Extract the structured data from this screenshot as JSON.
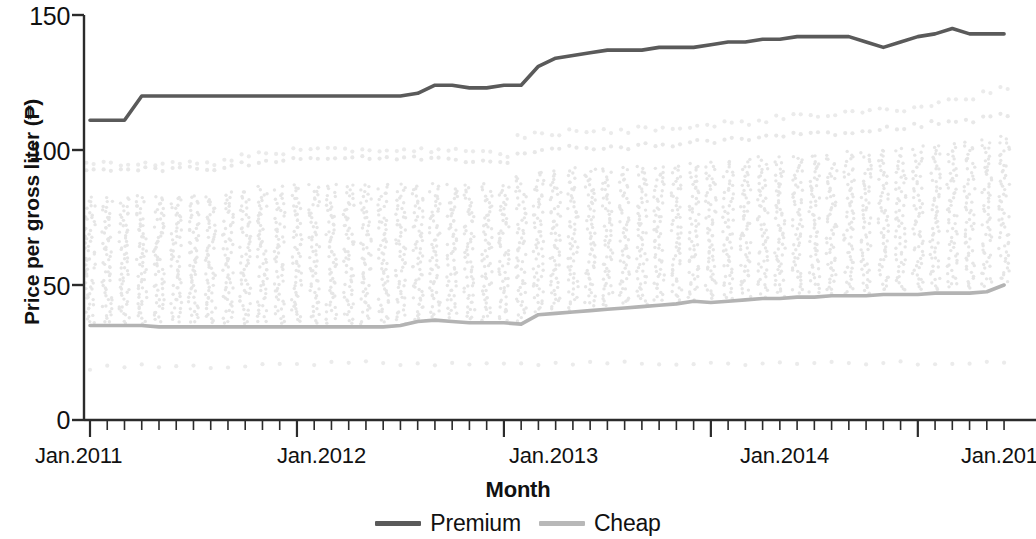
{
  "chart_data": {
    "type": "line",
    "title": "",
    "xlabel": "Month",
    "ylabel": "Price per gross liter (₱)",
    "ylim": [
      0,
      150
    ],
    "yticks": [
      0,
      50,
      100,
      150
    ],
    "ytick_labels": [
      "0",
      "50",
      "100",
      "150"
    ],
    "xlim": [
      "Jan.2011",
      "Jun.2015"
    ],
    "xticks": [
      "Jan.2011",
      "Jan.2012",
      "Jan.2013",
      "Jan.2014",
      "Jan.2015"
    ],
    "xtick_labels": [
      "Jan.2011",
      "Jan.2012",
      "Jan.2013",
      "Jan.2014",
      "Jan.2015"
    ],
    "grid": false,
    "legend_position": "bottom-center",
    "x_minor_tick_interval_months": 1,
    "n_months": 54,
    "series": [
      {
        "name": "Premium",
        "color": "#5a5a5a",
        "style": "solid-line",
        "values": [
          111,
          111,
          111,
          120,
          120,
          120,
          120,
          120,
          120,
          120,
          120,
          120,
          120,
          120,
          120,
          120,
          120,
          120,
          120,
          121,
          124,
          124,
          123,
          123,
          124,
          124,
          131,
          134,
          135,
          136,
          137,
          137,
          137,
          138,
          138,
          138,
          139,
          140,
          140,
          141,
          141,
          142,
          142,
          142,
          142,
          140,
          138,
          140,
          142,
          143,
          145,
          143,
          143,
          143
        ]
      },
      {
        "name": "Cheap",
        "color": "#b3b3b3",
        "style": "solid-line",
        "values": [
          35,
          35,
          35,
          35,
          34.5,
          34.5,
          34.5,
          34.5,
          34.5,
          34.5,
          34.5,
          34.5,
          34.5,
          34.5,
          34.5,
          34.5,
          34.5,
          34.5,
          35,
          36.5,
          37,
          36.5,
          36,
          36,
          36,
          35.5,
          39,
          39.5,
          40,
          40.5,
          41,
          41.5,
          42,
          42.5,
          43,
          44,
          43.5,
          44,
          44.5,
          45,
          45,
          45.5,
          45.5,
          46,
          46,
          46,
          46.5,
          46.5,
          46.5,
          47,
          47,
          47,
          47.5,
          50
        ]
      }
    ],
    "scatter_bands": [
      {
        "name": "upper-outlier-dots",
        "color": "#ebebeb",
        "values": [
          95,
          95,
          95,
          95,
          95,
          95,
          95,
          95,
          96,
          98,
          99,
          99,
          100,
          100,
          100,
          100,
          100,
          100,
          100,
          100,
          100,
          100,
          99,
          99,
          98,
          105,
          106,
          106,
          107,
          107,
          107,
          107,
          108,
          108,
          108,
          109,
          109,
          110,
          110,
          111,
          112,
          113,
          113,
          113,
          114,
          114,
          115,
          115,
          116,
          117,
          118,
          119,
          121,
          123
        ]
      },
      {
        "name": "secondary-upper-dots",
        "color": "#e8e8e8",
        "values": [
          93,
          93,
          93,
          93,
          93,
          93,
          93,
          93,
          94,
          95,
          96,
          96,
          97,
          97,
          97,
          97,
          97,
          97,
          97,
          97,
          97,
          97,
          96,
          96,
          96,
          99,
          100,
          100,
          101,
          101,
          101,
          101,
          102,
          102,
          102,
          103,
          103,
          104,
          104,
          105,
          105,
          106,
          106,
          106,
          107,
          107,
          108,
          108,
          109,
          110,
          110,
          111,
          112,
          113
        ]
      },
      {
        "name": "lower-outlier-dots",
        "color": "#ebebeb",
        "values": [
          19,
          19.5,
          20,
          20,
          20,
          20,
          20,
          20,
          20,
          20.5,
          20.5,
          20.5,
          21,
          21,
          21,
          21,
          21,
          21,
          21,
          21,
          21,
          21,
          21,
          21,
          21,
          21,
          21,
          21,
          21,
          21,
          21,
          21,
          21,
          21,
          21,
          21,
          21,
          21,
          21,
          21,
          21,
          21,
          21,
          21,
          21,
          21,
          21,
          21,
          21,
          21,
          21,
          21,
          21,
          21
        ]
      }
    ],
    "scatter_columns": {
      "name": "monthly-observation-dots",
      "color": "#e6e6e6",
      "description": "vertical column of individual price observations per month",
      "top_values": [
        82,
        82,
        82,
        83,
        83,
        83,
        83,
        83,
        84,
        85,
        86,
        86,
        87,
        87,
        87,
        87,
        87,
        87,
        87,
        87,
        87,
        87,
        87,
        87,
        87,
        90,
        92,
        92,
        93,
        93,
        93,
        93,
        94,
        94,
        94,
        95,
        95,
        96,
        96,
        97,
        97,
        98,
        98,
        98,
        99,
        99,
        100,
        100,
        101,
        102,
        102,
        103,
        104,
        105
      ],
      "bottom_values": [
        36,
        36,
        36,
        36,
        36,
        36,
        36,
        36,
        36,
        36,
        36,
        36,
        36,
        36,
        36,
        36,
        36,
        36,
        36,
        37,
        38,
        38,
        37,
        37,
        37,
        37,
        40,
        41,
        41,
        42,
        42,
        43,
        43,
        44,
        44,
        45,
        45,
        45,
        46,
        46,
        46,
        47,
        47,
        47,
        47,
        47,
        48,
        48,
        48,
        48,
        49,
        49,
        49,
        51
      ]
    }
  },
  "axes": {
    "y_tick_labels": [
      "150",
      "100",
      "50",
      "0"
    ],
    "x_tick_labels": [
      "Jan.2011",
      "Jan.2012",
      "Jan.2013",
      "Jan.2014",
      "Jan.2015"
    ],
    "y_axis_title": "Price per gross liter (₱)",
    "x_axis_title": "Month"
  },
  "legend": {
    "items": [
      {
        "label": "Premium",
        "color": "#5a5a5a"
      },
      {
        "label": "Cheap",
        "color": "#b8b8b8"
      }
    ]
  }
}
